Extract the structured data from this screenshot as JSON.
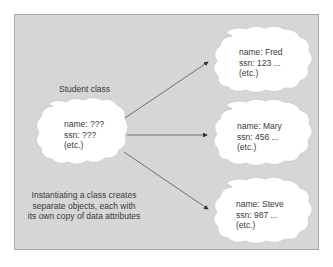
{
  "class_label": "Student class",
  "class_cloud": {
    "lines": [
      "name: ???",
      "ssn: ???",
      "(etc.)"
    ]
  },
  "instances": [
    {
      "lines": [
        "name: Fred",
        "ssn: 123 ...",
        "(etc.)"
      ]
    },
    {
      "lines": [
        "name: Mary",
        "ssn: 456 ...",
        "(etc.)"
      ]
    },
    {
      "lines": [
        "name: Steve",
        "ssn: 987 ...",
        "(etc.)"
      ]
    }
  ],
  "caption": {
    "lines": [
      "Instantiating a class creates",
      "separate objects, each with",
      "its own copy of data attributes"
    ]
  },
  "colors": {
    "panel_bg": "#d6d6d6",
    "cloud_fill": "#ffffff",
    "arrow": "#555555",
    "text": "#3a3a3a"
  }
}
